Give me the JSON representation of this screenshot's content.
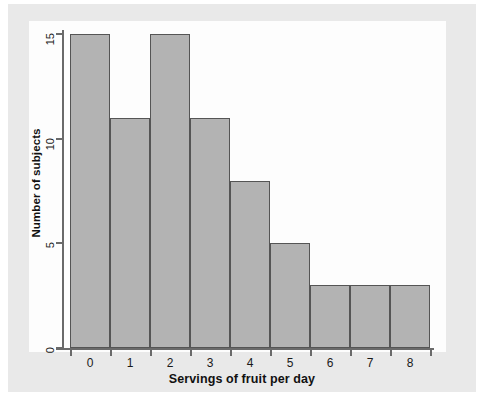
{
  "chart_data": {
    "type": "bar",
    "title": "",
    "subtitle": "",
    "xlabel": "Servings of fruit per day",
    "ylabel": "Number of subjects",
    "categories": [
      "0",
      "1",
      "2",
      "3",
      "4",
      "5",
      "6",
      "7",
      "8"
    ],
    "values": [
      15,
      11,
      15,
      11,
      8,
      5,
      3,
      3,
      3
    ],
    "xlim": [
      -0.5,
      8.5
    ],
    "ylim": [
      0,
      15
    ],
    "xticks": [
      "0",
      "1",
      "2",
      "3",
      "4",
      "5",
      "6",
      "7",
      "8"
    ],
    "yticks": [
      "0",
      "5",
      "10",
      "15"
    ],
    "ytick_values": [
      0,
      5,
      10,
      15
    ],
    "grid": false,
    "legend": null,
    "legend_position": "none",
    "annotations": [],
    "bar_fill_color": "#b3b3b3",
    "bar_edge_color": "#555555",
    "axis_color": "#6a6a6a",
    "panel_color": "#fdfdfd",
    "figure_background_color": "#e9e9e9",
    "text_color": "#111111"
  }
}
